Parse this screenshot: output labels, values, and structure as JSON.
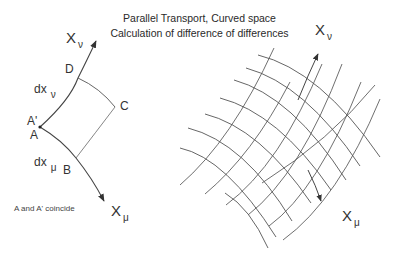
{
  "title": {
    "line1": "Parallel Transport,  Curved space",
    "line2": "Calculation of difference of differences"
  },
  "left_diagram": {
    "axis_nu": {
      "base": "X",
      "sub": "ν"
    },
    "axis_mu": {
      "base": "X",
      "sub": "μ"
    },
    "points": {
      "A_prime": "A'",
      "A": "A",
      "B": "B",
      "C": "C",
      "D": "D"
    },
    "dx_nu": {
      "base": "dx",
      "sub": "ν"
    },
    "dx_mu": {
      "base": "dx",
      "sub": "μ"
    },
    "note": "A and A' coincide"
  },
  "right_diagram": {
    "axis_nu": {
      "base": "X",
      "sub": "ν"
    },
    "axis_mu": {
      "base": "X",
      "sub": "μ"
    },
    "grid_lines_mu_direction": 8,
    "grid_lines_nu_direction": 8
  },
  "colors": {
    "line": "#444444",
    "grid": "#555555",
    "text": "#333333",
    "background": "#ffffff"
  }
}
